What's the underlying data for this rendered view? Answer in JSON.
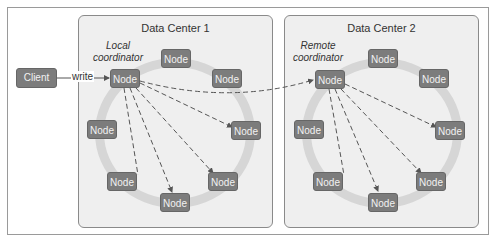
{
  "diagram": {
    "client": {
      "label": "Client"
    },
    "write_label": "write",
    "data_centers": [
      {
        "title": "Data Center 1",
        "coordinator_label": [
          "Local",
          "coordinator"
        ],
        "nodes": [
          "Node",
          "Node",
          "Node",
          "Node",
          "Node",
          "Node",
          "Node",
          "Node"
        ]
      },
      {
        "title": "Data Center 2",
        "coordinator_label": [
          "Remote",
          "coordinator"
        ],
        "nodes": [
          "Node",
          "Node",
          "Node",
          "Node",
          "Node",
          "Node",
          "Node",
          "Node"
        ]
      }
    ],
    "colors": {
      "node_fill": "#7c7c7c",
      "dc_background": "#efefef",
      "ring": "#d6d6d6",
      "arrow": "#555555"
    }
  }
}
